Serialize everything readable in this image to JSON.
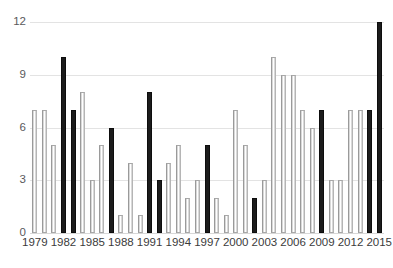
{
  "chart_data": {
    "type": "bar",
    "title": "",
    "subtitle": "",
    "xlabel": "",
    "ylabel": "",
    "categories": [
      "1979",
      "1980",
      "1981",
      "1982",
      "1983",
      "1984",
      "1985",
      "1986",
      "1987",
      "1988",
      "1989",
      "1990",
      "1991",
      "1992",
      "1993",
      "1994",
      "1995",
      "1996",
      "1997",
      "1998",
      "1999",
      "2000",
      "2001",
      "2002",
      "2003",
      "2004",
      "2005",
      "2006",
      "2007",
      "2008",
      "2009",
      "2010",
      "2011",
      "2012",
      "2013",
      "2014",
      "2015"
    ],
    "values": [
      7,
      7,
      5,
      10,
      7,
      8,
      3,
      5,
      6,
      1,
      4,
      1,
      8,
      3,
      4,
      5,
      2,
      3,
      5,
      2,
      1,
      7,
      5,
      2,
      3,
      10,
      9,
      9,
      7,
      6,
      7,
      3,
      3,
      7,
      7,
      7,
      12
    ],
    "bar_styles": [
      "light",
      "light",
      "light",
      "dark",
      "dark",
      "light",
      "light",
      "light",
      "dark",
      "light",
      "light",
      "light",
      "dark",
      "dark",
      "light",
      "light",
      "light",
      "light",
      "dark",
      "light",
      "light",
      "light",
      "light",
      "dark",
      "light",
      "light",
      "light",
      "light",
      "light",
      "light",
      "dark",
      "light",
      "light",
      "light",
      "light",
      "dark",
      "dark"
    ],
    "ylim": [
      0,
      12
    ],
    "yticks": [
      0,
      3,
      6,
      9,
      12
    ],
    "ytick_labels": [
      "0",
      "3",
      "6",
      "9",
      "12"
    ],
    "xtick_labels": [
      "1979",
      "1982",
      "1985",
      "1988",
      "1991",
      "1994",
      "1997",
      "2000",
      "2003",
      "2006",
      "2009",
      "2012",
      "2015"
    ],
    "xtick_indices": [
      0,
      3,
      6,
      9,
      12,
      15,
      18,
      21,
      24,
      27,
      30,
      33,
      36
    ],
    "grid": true,
    "grid_axis": "y",
    "legend": false,
    "legend_position": "none",
    "annotations": [],
    "colors": {
      "bar_dark": "#1c1c1c",
      "bar_light_fill": "#ffffff",
      "bar_light_edge": "#a8a8a8",
      "gridline": "#e3e3e3",
      "axis_text": "#3b3b3b",
      "ytick_text": "#59595b",
      "background": "#ffffff"
    }
  }
}
